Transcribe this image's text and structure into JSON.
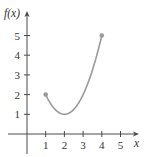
{
  "chart_data": {
    "type": "line",
    "title": "",
    "xlabel": "x",
    "ylabel": "f(x)",
    "x_ticks": [
      1,
      2,
      3,
      4,
      5
    ],
    "y_ticks": [
      1,
      2,
      3,
      4,
      5
    ],
    "x_tick_labels": [
      "1",
      "2",
      "3",
      "4",
      "5"
    ],
    "y_tick_labels": [
      "1",
      "2",
      "3",
      "4",
      "5"
    ],
    "xlim": [
      0,
      6
    ],
    "ylim": [
      0,
      6
    ],
    "grid": false,
    "legend": null,
    "series": [
      {
        "name": "f(x)",
        "function": "(x-2)^2 + 1",
        "domain": [
          1,
          4
        ],
        "x": [
          1,
          1.5,
          2,
          2.5,
          3,
          3.5,
          4
        ],
        "values": [
          2,
          1.25,
          1,
          1.25,
          2,
          3.25,
          5
        ],
        "endpoints": [
          {
            "x": 1,
            "y": 2,
            "marker": "closed-dot"
          },
          {
            "x": 4,
            "y": 5,
            "marker": "closed-dot"
          }
        ],
        "color": "#9a9a9a"
      }
    ]
  },
  "labels": {
    "y_axis": "f(x)",
    "x_axis": "x"
  },
  "colors": {
    "axis": "#4a4a4a",
    "curve": "#9a9a9a",
    "text": "#333333"
  }
}
